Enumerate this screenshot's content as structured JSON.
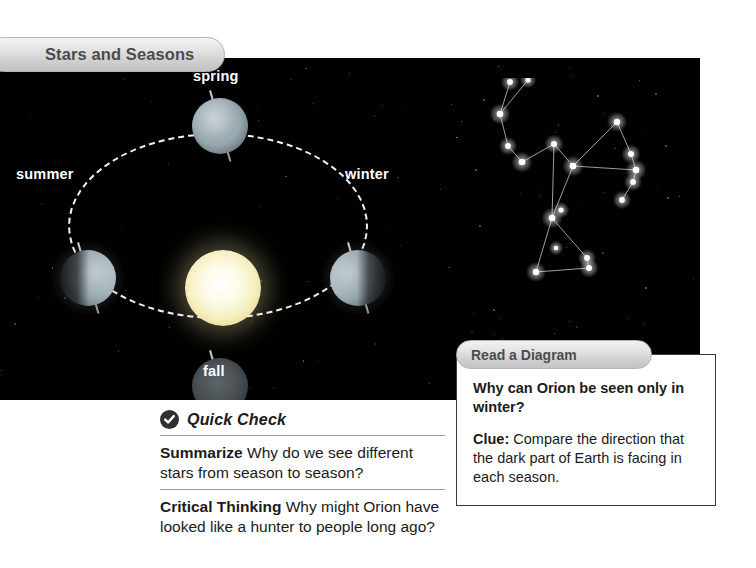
{
  "section": {
    "tab_label": "Stars and Seasons"
  },
  "diagram": {
    "type": "orbit-seasons",
    "sun_name": "sun",
    "season_labels": [
      {
        "key": "spring",
        "label": "spring"
      },
      {
        "key": "summer",
        "label": "summer"
      },
      {
        "key": "winter",
        "label": "winter"
      },
      {
        "key": "fall",
        "label": "fall"
      }
    ],
    "constellation": {
      "name": "Orion",
      "star_color": "#ffffff",
      "line_color": "#b9b9b9",
      "stars": [
        {
          "x": 40,
          "y": 4,
          "r": 4.0
        },
        {
          "x": 58,
          "y": 2,
          "r": 3.6
        },
        {
          "x": 30,
          "y": 36,
          "r": 4.6
        },
        {
          "x": 38,
          "y": 68,
          "r": 4.0
        },
        {
          "x": 52,
          "y": 84,
          "r": 4.6
        },
        {
          "x": 84,
          "y": 66,
          "r": 4.2
        },
        {
          "x": 103,
          "y": 88,
          "r": 4.6
        },
        {
          "x": 147,
          "y": 44,
          "r": 4.4
        },
        {
          "x": 161,
          "y": 76,
          "r": 4.2
        },
        {
          "x": 166,
          "y": 92,
          "r": 4.6
        },
        {
          "x": 163,
          "y": 104,
          "r": 4.0
        },
        {
          "x": 152,
          "y": 122,
          "r": 4.0
        },
        {
          "x": 82,
          "y": 140,
          "r": 4.6
        },
        {
          "x": 91,
          "y": 132,
          "r": 3.6
        },
        {
          "x": 86,
          "y": 170,
          "r": 3.2
        },
        {
          "x": 66,
          "y": 194,
          "r": 4.4
        },
        {
          "x": 117,
          "y": 180,
          "r": 4.0
        },
        {
          "x": 119,
          "y": 190,
          "r": 4.2
        }
      ],
      "edges": [
        [
          0,
          2
        ],
        [
          1,
          2
        ],
        [
          2,
          3
        ],
        [
          3,
          4
        ],
        [
          4,
          5
        ],
        [
          5,
          6
        ],
        [
          6,
          7
        ],
        [
          7,
          8
        ],
        [
          8,
          9
        ],
        [
          9,
          10
        ],
        [
          10,
          11
        ],
        [
          5,
          12
        ],
        [
          6,
          12
        ],
        [
          12,
          15
        ],
        [
          15,
          17
        ],
        [
          17,
          16
        ],
        [
          16,
          12
        ],
        [
          6,
          9
        ]
      ],
      "background_specks": [
        {
          "x": 14,
          "y": 22
        },
        {
          "x": 186,
          "y": 16
        },
        {
          "x": 198,
          "y": 120
        },
        {
          "x": 10,
          "y": 148
        },
        {
          "x": 176,
          "y": 210
        },
        {
          "x": 24,
          "y": 232
        },
        {
          "x": 128,
          "y": 18
        },
        {
          "x": 196,
          "y": 68
        },
        {
          "x": 6,
          "y": 92
        }
      ]
    }
  },
  "read_a_diagram": {
    "tab_label": "Read a Diagram",
    "question": "Why can Orion be seen only in winter?",
    "clue_label": "Clue:",
    "clue_text": " Compare the direction that the dark part of Earth is facing in each season."
  },
  "quick_check": {
    "badge_icon": "check-icon",
    "title": "Quick Check",
    "items": [
      {
        "label": "Summarize",
        "text": "  Why do we see different stars from season to season?"
      },
      {
        "label": "Critical Thinking",
        "text": "  Why might Orion have looked like a hunter to people long ago?"
      }
    ]
  },
  "colors": {
    "space_background": "#010101",
    "tab_text": "#4c4c4c",
    "body_text": "#1b1b1b",
    "rule": "#9a9a9a",
    "sun": "#f6efc0"
  }
}
